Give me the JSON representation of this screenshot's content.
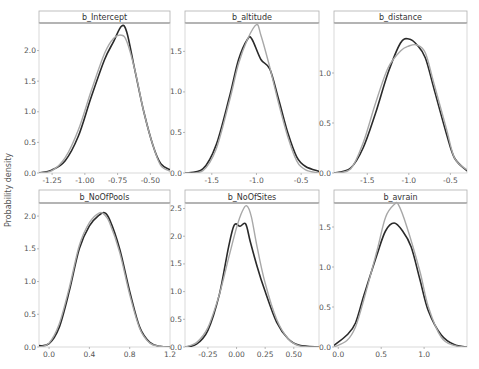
{
  "figure": {
    "y_axis_label": "Probability density",
    "colors": {
      "series_dark": "#2a2a2a",
      "series_light": "#a8a8a8",
      "strip_border": "#888888",
      "panel_border": "#d0d0d0",
      "background": "#ffffff"
    }
  },
  "chart_data": [
    {
      "type": "line",
      "title": "b_Intercept",
      "xlabel": "",
      "ylabel": "Probability density",
      "xlim": [
        -1.35,
        -0.35
      ],
      "ylim": [
        0,
        2.45
      ],
      "xticks": [
        -1.25,
        -1.0,
        -0.75,
        -0.5
      ],
      "xtick_labels": [
        "-1.25",
        "-1.00",
        "-0.75",
        "-0.50"
      ],
      "yticks": [
        0.0,
        0.5,
        1.0,
        1.5,
        2.0
      ],
      "ytick_labels": [
        "0.0",
        "0.5",
        "1.0",
        "1.5",
        "2.0"
      ],
      "grid": false,
      "series": [
        {
          "name": "dark",
          "x": [
            -1.35,
            -1.25,
            -1.15,
            -1.05,
            -0.95,
            -0.85,
            -0.78,
            -0.72,
            -0.68,
            -0.62,
            -0.55,
            -0.48,
            -0.42,
            -0.35
          ],
          "y": [
            0.0,
            0.05,
            0.2,
            0.6,
            1.25,
            1.85,
            2.15,
            2.4,
            2.3,
            1.7,
            1.0,
            0.45,
            0.15,
            0.05
          ]
        },
        {
          "name": "light",
          "x": [
            -1.35,
            -1.25,
            -1.15,
            -1.05,
            -0.95,
            -0.85,
            -0.78,
            -0.72,
            -0.68,
            -0.62,
            -0.55,
            -0.48,
            -0.42,
            -0.35
          ],
          "y": [
            0.0,
            0.04,
            0.25,
            0.7,
            1.35,
            1.95,
            2.2,
            2.25,
            2.15,
            1.7,
            1.0,
            0.45,
            0.12,
            0.03
          ]
        }
      ]
    },
    {
      "type": "line",
      "title": "b_altitude",
      "xlabel": "",
      "ylabel": "",
      "xlim": [
        -1.8,
        -0.3
      ],
      "ylim": [
        0,
        1.85
      ],
      "xticks": [
        -1.5,
        -1.0,
        -0.5
      ],
      "xtick_labels": [
        "-1.5",
        "-1.0",
        "-0.5"
      ],
      "yticks": [
        0.0,
        0.5,
        1.0,
        1.5
      ],
      "ytick_labels": [
        "0.0",
        "0.5",
        "1.0",
        "1.5"
      ],
      "grid": false,
      "series": [
        {
          "name": "dark",
          "x": [
            -1.8,
            -1.6,
            -1.45,
            -1.3,
            -1.2,
            -1.1,
            -1.05,
            -0.95,
            -0.85,
            -0.75,
            -0.65,
            -0.55,
            -0.45,
            -0.3
          ],
          "y": [
            0.0,
            0.05,
            0.35,
            0.95,
            1.4,
            1.65,
            1.65,
            1.4,
            1.28,
            0.9,
            0.5,
            0.2,
            0.08,
            0.02
          ]
        },
        {
          "name": "light",
          "x": [
            -1.8,
            -1.6,
            -1.45,
            -1.3,
            -1.2,
            -1.1,
            -1.0,
            -0.95,
            -0.85,
            -0.75,
            -0.65,
            -0.55,
            -0.45,
            -0.3
          ],
          "y": [
            0.0,
            0.03,
            0.3,
            0.9,
            1.35,
            1.65,
            1.83,
            1.7,
            1.3,
            0.85,
            0.45,
            0.15,
            0.04,
            0.0
          ]
        }
      ]
    },
    {
      "type": "line",
      "title": "b_distance",
      "xlabel": "",
      "ylabel": "",
      "xlim": [
        -1.9,
        -0.3
      ],
      "ylim": [
        0,
        1.5
      ],
      "xticks": [
        -1.5,
        -1.0,
        -0.5
      ],
      "xtick_labels": [
        "-1.5",
        "-1.0",
        "-0.5"
      ],
      "yticks": [
        0.0,
        0.5,
        1.0
      ],
      "ytick_labels": [
        "0.0",
        "0.5",
        "1.0"
      ],
      "grid": false,
      "series": [
        {
          "name": "dark",
          "x": [
            -1.9,
            -1.7,
            -1.55,
            -1.4,
            -1.25,
            -1.1,
            -1.0,
            -0.9,
            -0.8,
            -0.7,
            -0.55,
            -0.45,
            -0.3
          ],
          "y": [
            0.0,
            0.05,
            0.25,
            0.6,
            1.0,
            1.3,
            1.34,
            1.28,
            1.15,
            0.85,
            0.4,
            0.15,
            0.02
          ]
        },
        {
          "name": "light",
          "x": [
            -1.9,
            -1.7,
            -1.55,
            -1.4,
            -1.25,
            -1.1,
            -1.0,
            -0.9,
            -0.8,
            -0.7,
            -0.55,
            -0.45,
            -0.3
          ],
          "y": [
            0.0,
            0.04,
            0.3,
            0.7,
            1.05,
            1.22,
            1.27,
            1.28,
            1.2,
            0.9,
            0.45,
            0.15,
            0.03
          ]
        }
      ]
    },
    {
      "type": "line",
      "title": "b_NoOfPools",
      "xlabel": "",
      "ylabel": "Probability density",
      "xlim": [
        -0.1,
        1.2
      ],
      "ylim": [
        0,
        2.2
      ],
      "xticks": [
        0.0,
        0.4,
        0.8,
        1.2
      ],
      "xtick_labels": [
        "0.0",
        "0.4",
        "0.8",
        "1.2"
      ],
      "yticks": [
        0.0,
        0.5,
        1.0,
        1.5,
        2.0
      ],
      "ytick_labels": [
        "0.0",
        "0.5",
        "1.0",
        "1.5",
        "2.0"
      ],
      "grid": false,
      "series": [
        {
          "name": "dark",
          "x": [
            -0.1,
            0.0,
            0.1,
            0.2,
            0.3,
            0.4,
            0.5,
            0.55,
            0.6,
            0.7,
            0.8,
            0.9,
            1.0,
            1.1,
            1.2
          ],
          "y": [
            0.02,
            0.05,
            0.3,
            0.85,
            1.5,
            1.85,
            2.02,
            2.05,
            1.95,
            1.5,
            0.85,
            0.3,
            0.07,
            0.01,
            0.0
          ]
        },
        {
          "name": "light",
          "x": [
            -0.1,
            0.0,
            0.1,
            0.2,
            0.3,
            0.4,
            0.5,
            0.55,
            0.6,
            0.7,
            0.8,
            0.9,
            1.0,
            1.1,
            1.2
          ],
          "y": [
            0.0,
            0.06,
            0.35,
            0.9,
            1.55,
            1.9,
            2.05,
            2.02,
            1.9,
            1.45,
            0.8,
            0.28,
            0.06,
            0.01,
            0.0
          ]
        }
      ]
    },
    {
      "type": "line",
      "title": "b_NoOfSites",
      "xlabel": "",
      "ylabel": "",
      "xlim": [
        -0.45,
        0.72
      ],
      "ylim": [
        0,
        2.6
      ],
      "xticks": [
        -0.25,
        0.0,
        0.25,
        0.5
      ],
      "xtick_labels": [
        "-0.25",
        "0.00",
        "0.25",
        "0.50"
      ],
      "yticks": [
        0.0,
        0.5,
        1.0,
        1.5,
        2.0,
        2.5
      ],
      "ytick_labels": [
        "0.0",
        "0.5",
        "1.0",
        "1.5",
        "2.0",
        "2.5"
      ],
      "grid": false,
      "series": [
        {
          "name": "dark",
          "x": [
            -0.45,
            -0.35,
            -0.25,
            -0.15,
            -0.07,
            -0.02,
            0.03,
            0.08,
            0.12,
            0.18,
            0.25,
            0.35,
            0.45,
            0.55,
            0.72
          ],
          "y": [
            0.0,
            0.05,
            0.3,
            0.95,
            1.8,
            2.2,
            2.18,
            2.22,
            1.9,
            1.45,
            1.0,
            0.45,
            0.15,
            0.03,
            0.0
          ]
        },
        {
          "name": "light",
          "x": [
            -0.45,
            -0.35,
            -0.25,
            -0.15,
            -0.07,
            0.0,
            0.05,
            0.09,
            0.13,
            0.18,
            0.25,
            0.35,
            0.45,
            0.55,
            0.72
          ],
          "y": [
            0.0,
            0.08,
            0.35,
            0.95,
            1.6,
            2.15,
            2.45,
            2.55,
            2.35,
            1.8,
            1.15,
            0.5,
            0.15,
            0.02,
            0.0
          ]
        }
      ]
    },
    {
      "type": "line",
      "title": "b_avrain",
      "xlabel": "",
      "ylabel": "",
      "xlim": [
        -0.05,
        1.5
      ],
      "ylim": [
        0,
        1.8
      ],
      "xticks": [
        0.0,
        0.5,
        1.0
      ],
      "xtick_labels": [
        "0.0",
        "0.5",
        "1.0"
      ],
      "yticks": [
        0.0,
        0.5,
        1.0,
        1.5
      ],
      "ytick_labels": [
        "0.0",
        "0.5",
        "1.0",
        "1.5"
      ],
      "grid": false,
      "series": [
        {
          "name": "dark",
          "x": [
            -0.05,
            0.1,
            0.2,
            0.3,
            0.45,
            0.55,
            0.65,
            0.75,
            0.85,
            0.95,
            1.05,
            1.2,
            1.35,
            1.5
          ],
          "y": [
            0.02,
            0.15,
            0.3,
            0.65,
            1.15,
            1.45,
            1.55,
            1.45,
            1.25,
            0.85,
            0.45,
            0.15,
            0.03,
            0.0
          ]
        },
        {
          "name": "light",
          "x": [
            -0.05,
            0.1,
            0.2,
            0.3,
            0.45,
            0.55,
            0.65,
            0.7,
            0.8,
            0.95,
            1.05,
            1.2,
            1.35,
            1.5
          ],
          "y": [
            0.0,
            0.08,
            0.25,
            0.6,
            1.2,
            1.62,
            1.78,
            1.78,
            1.5,
            0.95,
            0.5,
            0.12,
            0.02,
            0.0
          ]
        }
      ]
    }
  ]
}
